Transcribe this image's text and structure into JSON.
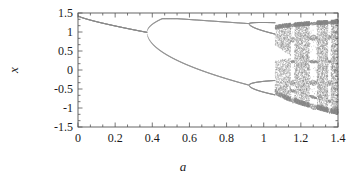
{
  "chart_data": {
    "type": "scatter",
    "title": "",
    "subtitle": "",
    "xlabel": "a",
    "ylabel": "x",
    "xlim": [
      0,
      1.4
    ],
    "ylim": [
      -1.5,
      1.5
    ],
    "xticks": [
      0,
      0.2,
      0.4,
      0.6,
      0.8,
      1,
      1.2,
      1.4
    ],
    "xtick_labels": [
      "0",
      "0.2",
      "0.4",
      "0.6",
      "0.8",
      "1",
      "1.2",
      "1.4"
    ],
    "yticks": [
      -1.5,
      -1,
      -0.5,
      0,
      0.5,
      1,
      1.5
    ],
    "ytick_labels": [
      "-1.5",
      "-1",
      "-0.5",
      "0",
      "0.5",
      "1",
      "1.5"
    ],
    "x_minor_ticks_per_interval": 2,
    "y_minor_ticks_per_interval": 2,
    "grid": false,
    "legend": null,
    "point_color": "#8a8a8a",
    "frame_color": "#555555",
    "background": "#ffffff",
    "branches": {
      "period_1": {
        "a_range": [
          0.0,
          0.37
        ],
        "x_start": 1.42,
        "x_end": 0.99
      },
      "period_2": {
        "a_range": [
          0.37,
          0.92
        ],
        "upper_peak_x": 1.35,
        "upper_end_x": 1.22,
        "lower_end_x": -0.4
      },
      "period_4": {
        "a_range": [
          0.92,
          1.06
        ]
      },
      "chaos": {
        "a_range": [
          1.06,
          1.4
        ],
        "x_min": -1.15,
        "x_max": 1.32
      }
    },
    "bifurcation_points_a": [
      0.37,
      0.92,
      1.02,
      1.06
    ],
    "periodic_windows_a": [
      [
        1.145,
        1.165
      ],
      [
        1.245,
        1.285
      ],
      [
        1.345,
        1.36
      ]
    ],
    "geometry": {
      "plot_left_px": 78,
      "plot_right_px": 338,
      "plot_top_px": 13,
      "plot_bottom_px": 127
    }
  }
}
